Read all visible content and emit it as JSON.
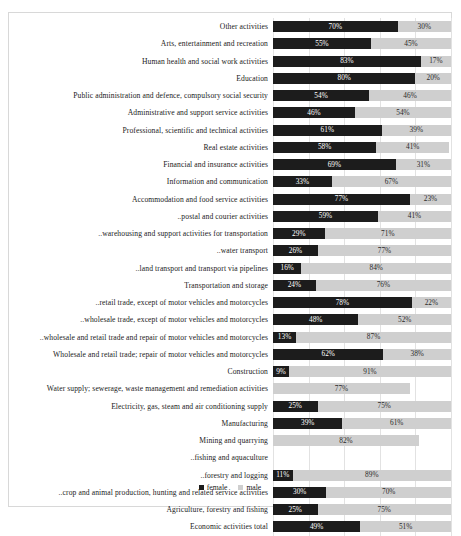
{
  "legend": {
    "female_label": "female",
    "male_label": "male"
  },
  "axis": {
    "gridline_positions": [
      0,
      20,
      40,
      60,
      80,
      100
    ]
  },
  "colors": {
    "female": "#1c1c1c",
    "male": "#cfcfcf",
    "grid": "#e2e2e2",
    "frame": "#d8d8d8"
  },
  "chart_data": {
    "type": "bar",
    "orientation": "horizontal",
    "stacked": true,
    "title": "",
    "xlabel": "",
    "ylabel": "",
    "xlim": [
      0,
      100
    ],
    "grid": true,
    "legend_position": "bottom",
    "series": [
      {
        "name": "female",
        "color": "#1c1c1c"
      },
      {
        "name": "male",
        "color": "#cfcfcf"
      }
    ],
    "categories": [
      "Other activities",
      "Arts, entertainment and recreation",
      "Human health and social work activities",
      "Education",
      "Public administration and defence, compulsory social security",
      "Administrative and support service activities",
      "Professional, scientific and technical activities",
      "Real estate activities",
      "Financial and insurance activities",
      "Information and communication",
      "Accommodation and food service activities",
      "..postal and courier activities",
      "..warehousing and support activities for transportation",
      "..water transport",
      "..land transport and transport via pipelines",
      "Transportation and storage",
      "..retail trade, except of motor vehicles and motorcycles",
      "..wholesale trade, except of motor vehicles and motorcycles",
      "..wholesale and retail trade and repair of motor vehicles and motorcycles",
      "Wholesale and retail trade; repair of motor vehicles and motorcycles",
      "Construction",
      "Water supply; sewerage, waste management and remediation activities",
      "Electricity, gas, steam and air conditioning supply",
      "Manufacturing",
      "Mining and quarrying",
      "..fishing and aquaculture",
      "..forestry and logging",
      "..crop and animal production, hunting and related service activities",
      "Agriculture, forestry and fishing",
      "Economic activities total"
    ],
    "female_values": [
      70,
      55,
      83,
      80,
      54,
      46,
      61,
      58,
      69,
      33,
      77,
      59,
      29,
      26,
      16,
      24,
      78,
      48,
      13,
      62,
      9,
      null,
      25,
      39,
      null,
      null,
      11,
      30,
      25,
      49
    ],
    "male_values": [
      30,
      45,
      17,
      20,
      46,
      54,
      39,
      41,
      31,
      67,
      23,
      41,
      71,
      77,
      84,
      76,
      22,
      52,
      87,
      38,
      91,
      77,
      75,
      61,
      82,
      null,
      89,
      70,
      75,
      51
    ],
    "female_labels": [
      "70%",
      "55%",
      "83%",
      "80%",
      "54%",
      "46%",
      "61%",
      "58%",
      "69%",
      "33%",
      "77%",
      "59%",
      "29%",
      "26%",
      "16%",
      "24%",
      "78%",
      "48%",
      "13%",
      "62%",
      "9%",
      "",
      "25%",
      "39%",
      "",
      "",
      "11%",
      "30%",
      "25%",
      "49%"
    ],
    "male_labels": [
      "30%",
      "45%",
      "17%",
      "20%",
      "46%",
      "54%",
      "39%",
      "41%",
      "31%",
      "67%",
      "23%",
      "41%",
      "71%",
      "77%",
      "84%",
      "76%",
      "22%",
      "52%",
      "87%",
      "38%",
      "91%",
      "77%",
      "75%",
      "61%",
      "82%",
      "",
      "89%",
      "70%",
      "75%",
      "51%"
    ]
  }
}
